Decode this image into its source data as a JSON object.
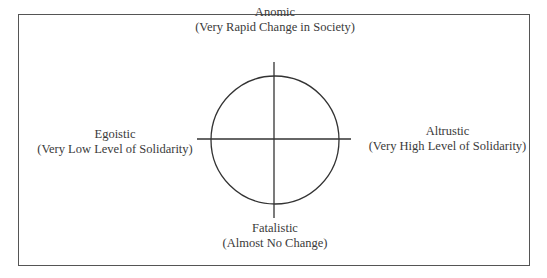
{
  "diagram": {
    "type": "quadrant-circle",
    "labels": {
      "top": {
        "title": "Anomic",
        "subtitle": "(Very Rapid Change in Society)"
      },
      "bottom": {
        "title": "Fatalistic",
        "subtitle": "(Almost No Change)"
      },
      "left": {
        "title": "Egoistic",
        "subtitle": "(Very Low Level of Solidarity)"
      },
      "right": {
        "title": "Altrustic",
        "subtitle": "(Very High Level of Solidarity)"
      }
    },
    "colors": {
      "line": "#333333",
      "border": "#555555",
      "text": "#3a3a3a"
    }
  }
}
